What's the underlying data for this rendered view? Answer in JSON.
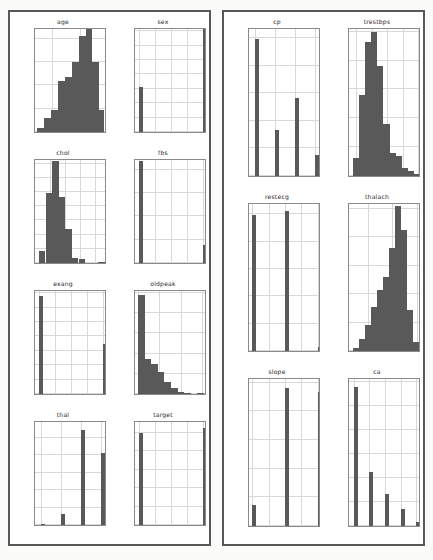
{
  "figure": {
    "kind": "histogram-grid",
    "background_color": "#ffffff",
    "bar_color": "#595959",
    "grid_color": "#d8d8d8",
    "axis_color": "#8a8a8a",
    "panel_border_color": "#585858",
    "panels": [
      {
        "name": "left-panel",
        "rows": 4,
        "cols": 2
      },
      {
        "name": "right-panel",
        "rows": 3,
        "cols": 2
      }
    ]
  },
  "chart_data": [
    {
      "type": "bar",
      "title": "age",
      "panel": "left",
      "row": 0,
      "col": 0,
      "xlabel": "",
      "ylabel": "",
      "grid": true,
      "xlim": [
        27.5,
        79.5
      ],
      "ylim": [
        0,
        225
      ],
      "xticks": [
        40,
        60
      ],
      "xticklabels": [
        "40",
        "60"
      ],
      "yticks": [
        0,
        50,
        100,
        150,
        200
      ],
      "yticklabels": [
        "0",
        "50",
        "100",
        "150",
        "200"
      ],
      "bin_edges": [
        29,
        34,
        39,
        44,
        49,
        54,
        59,
        64,
        69,
        74,
        77
      ],
      "values": [
        8,
        31,
        47,
        110,
        118,
        150,
        205,
        220,
        150,
        47,
        12
      ]
    },
    {
      "type": "bar",
      "title": "sex",
      "panel": "left",
      "row": 0,
      "col": 1,
      "xlabel": "",
      "ylabel": "",
      "grid": true,
      "xlim": [
        -0.06,
        1.06
      ],
      "ylim": [
        0,
        730
      ],
      "xticks": [
        0.0,
        0.25,
        0.5,
        0.75,
        1.0
      ],
      "xticklabels": [
        "0.00",
        "0.25",
        "0.50",
        "0.75",
        "1.00"
      ],
      "yticks": [
        0,
        100,
        200,
        300,
        400,
        500,
        600,
        700
      ],
      "yticklabels": [
        "0",
        "100",
        "200",
        "300",
        "400",
        "500",
        "600",
        "700"
      ],
      "categories": [
        0,
        1
      ],
      "values": [
        312,
        713
      ]
    },
    {
      "type": "bar",
      "title": "chol",
      "panel": "left",
      "row": 1,
      "col": 0,
      "xlabel": "",
      "ylabel": "",
      "grid": true,
      "xlim": [
        100,
        580
      ],
      "ylim": [
        0,
        370
      ],
      "xticks": [
        200,
        300,
        400,
        500
      ],
      "xticklabels": [
        "200",
        "300",
        "400",
        "500"
      ],
      "yticks": [
        0,
        50,
        100,
        150,
        200,
        250,
        300,
        350
      ],
      "yticklabels": [
        "0",
        "50",
        "100",
        "150",
        "200",
        "250",
        "300",
        "350"
      ],
      "bin_edges": [
        126,
        170,
        214,
        258,
        302,
        346,
        390,
        434,
        478,
        522,
        566
      ],
      "values": [
        42,
        248,
        360,
        232,
        120,
        18,
        14,
        0,
        0,
        2
      ]
    },
    {
      "type": "bar",
      "title": "fbs",
      "panel": "left",
      "row": 1,
      "col": 1,
      "xlabel": "",
      "ylabel": "",
      "grid": true,
      "xlim": [
        -0.06,
        1.06
      ],
      "ylim": [
        0,
        900
      ],
      "xticks": [
        0.0,
        0.25,
        0.5,
        0.75,
        1.0
      ],
      "xticklabels": [
        "0.00",
        "0.25",
        "0.50",
        "0.75",
        "1.00"
      ],
      "yticks": [
        0,
        200,
        400,
        600,
        800
      ],
      "yticklabels": [
        "0",
        "200",
        "400",
        "600",
        "800"
      ],
      "categories": [
        0,
        1
      ],
      "values": [
        872,
        153
      ]
    },
    {
      "type": "bar",
      "title": "exang",
      "panel": "left",
      "row": 2,
      "col": 0,
      "xlabel": "",
      "ylabel": "",
      "grid": true,
      "xlim": [
        -0.06,
        1.06
      ],
      "ylim": [
        0,
        730
      ],
      "xticks": [
        0.0,
        0.25,
        0.5,
        0.75,
        1.0
      ],
      "xticklabels": [
        "0.00",
        "0.25",
        "0.50",
        "0.75",
        "1.00"
      ],
      "yticks": [
        0,
        100,
        200,
        300,
        400,
        500,
        600,
        700
      ],
      "yticklabels": [
        "0",
        "100",
        "200",
        "300",
        "400",
        "500",
        "600",
        "700"
      ],
      "categories": [
        0,
        1
      ],
      "values": [
        680,
        345
      ]
    },
    {
      "type": "bar",
      "title": "oldpeak",
      "panel": "left",
      "row": 2,
      "col": 1,
      "xlabel": "",
      "ylabel": "",
      "grid": true,
      "xlim": [
        -0.3,
        6.5
      ],
      "ylim": [
        0,
        520
      ],
      "xticks": [
        0,
        2,
        4,
        6
      ],
      "xticklabels": [
        "0",
        "2",
        "4",
        "6"
      ],
      "yticks": [
        0,
        100,
        200,
        300,
        400,
        500
      ],
      "yticklabels": [
        "0",
        "100",
        "200",
        "300",
        "400",
        "500"
      ],
      "bin_edges": [
        0.0,
        0.62,
        1.24,
        1.86,
        2.48,
        3.1,
        3.72,
        4.34,
        4.96,
        5.58,
        6.2
      ],
      "values": [
        492,
        175,
        150,
        110,
        60,
        28,
        8,
        4,
        0,
        2
      ]
    },
    {
      "type": "bar",
      "title": "thal",
      "panel": "left",
      "row": 3,
      "col": 0,
      "xlabel": "",
      "ylabel": "",
      "grid": true,
      "xlim": [
        -0.3,
        3.3
      ],
      "ylim": [
        0,
        600
      ],
      "xticks": [
        0,
        1,
        2,
        3
      ],
      "xticklabels": [
        "0",
        "1",
        "2",
        "3"
      ],
      "yticks": [
        0,
        100,
        200,
        300,
        400,
        500
      ],
      "yticklabels": [
        "0",
        "100",
        "200",
        "300",
        "400",
        "500"
      ],
      "categories": [
        0,
        1,
        2,
        3
      ],
      "values": [
        7,
        64,
        544,
        410
      ]
    },
    {
      "type": "bar",
      "title": "target",
      "panel": "left",
      "row": 3,
      "col": 1,
      "xlabel": "",
      "ylabel": "",
      "grid": true,
      "xlim": [
        -0.06,
        1.06
      ],
      "ylim": [
        0,
        570
      ],
      "xticks": [
        0.0,
        0.25,
        0.5,
        0.75,
        1.0
      ],
      "xticklabels": [
        "0.00",
        "0.25",
        "0.50",
        "0.75",
        "1.00"
      ],
      "yticks": [
        0,
        100,
        200,
        300,
        400,
        500
      ],
      "yticklabels": [
        "0",
        "100",
        "200",
        "300",
        "400",
        "500"
      ],
      "categories": [
        0,
        1
      ],
      "values": [
        499,
        526
      ]
    },
    {
      "type": "bar",
      "title": "cp",
      "panel": "right",
      "row": 0,
      "col": 0,
      "xlabel": "",
      "ylabel": "",
      "grid": true,
      "xlim": [
        -0.3,
        3.3
      ],
      "ylim": [
        0,
        540
      ],
      "xticks": [
        0,
        1,
        2,
        3
      ],
      "xticklabels": [
        "0",
        "1",
        "2",
        "3"
      ],
      "yticks": [
        0,
        100,
        200,
        300,
        400,
        500
      ],
      "yticklabels": [
        "0",
        "100",
        "200",
        "300",
        "400",
        "500"
      ],
      "categories": [
        0,
        1,
        2,
        3
      ],
      "values": [
        497,
        167,
        284,
        77
      ]
    },
    {
      "type": "bar",
      "title": "trestbps",
      "panel": "right",
      "row": 0,
      "col": 1,
      "xlabel": "",
      "ylabel": "",
      "grid": true,
      "xlim": [
        88,
        205
      ],
      "ylim": [
        0,
        258
      ],
      "xticks": [
        100,
        125,
        150,
        175,
        200
      ],
      "xticklabels": [
        "100",
        "125",
        "150",
        "175",
        "200"
      ],
      "yticks": [
        0,
        50,
        100,
        150,
        200,
        250
      ],
      "yticklabels": [
        "0",
        "50",
        "100",
        "150",
        "200",
        "250"
      ],
      "bin_edges": [
        94,
        104,
        114,
        124,
        134,
        144,
        154,
        164,
        174,
        184,
        194,
        202
      ],
      "values": [
        32,
        140,
        232,
        250,
        190,
        90,
        40,
        35,
        14,
        8,
        3
      ]
    },
    {
      "type": "bar",
      "title": "restecg",
      "panel": "right",
      "row": 1,
      "col": 0,
      "xlabel": "",
      "ylabel": "",
      "grid": true,
      "xlim": [
        -0.1,
        2.1
      ],
      "ylim": [
        0,
        545
      ],
      "xticks": [
        0.0,
        0.5,
        1.0,
        1.5,
        2.0
      ],
      "xticklabels": [
        "0.0",
        "0.5",
        "1.0",
        "1.5",
        "2.0"
      ],
      "yticks": [
        0,
        100,
        200,
        300,
        400,
        500
      ],
      "yticklabels": [
        "0",
        "100",
        "200",
        "300",
        "400",
        "500"
      ],
      "categories": [
        0,
        1,
        2
      ],
      "values": [
        497,
        513,
        15
      ]
    },
    {
      "type": "bar",
      "title": "thalach",
      "panel": "right",
      "row": 1,
      "col": 1,
      "xlabel": "",
      "ylabel": "",
      "grid": true,
      "xlim": [
        62,
        208
      ],
      "ylim": [
        0,
        262
      ],
      "xticks": [
        100,
        150,
        200
      ],
      "xticklabels": [
        "100",
        "150",
        "200"
      ],
      "yticks": [
        0,
        50,
        100,
        150,
        200,
        250
      ],
      "yticklabels": [
        "0",
        "50",
        "100",
        "150",
        "200",
        "250"
      ],
      "bin_edges": [
        71,
        83,
        95,
        107,
        119,
        131,
        143,
        155,
        167,
        179,
        191,
        203
      ],
      "values": [
        5,
        22,
        45,
        78,
        108,
        130,
        182,
        255,
        212,
        72,
        16
      ]
    },
    {
      "type": "bar",
      "title": "slope",
      "panel": "right",
      "row": 2,
      "col": 0,
      "xlabel": "",
      "ylabel": "",
      "grid": true,
      "xlim": [
        -0.1,
        2.1
      ],
      "ylim": [
        0,
        520
      ],
      "xticks": [
        0.0,
        0.5,
        1.0,
        1.5,
        2.0
      ],
      "xticklabels": [
        "0.0",
        "0.5",
        "1.0",
        "1.5",
        "2.0"
      ],
      "yticks": [
        0,
        100,
        200,
        300,
        400,
        500
      ],
      "yticklabels": [
        "0",
        "100",
        "200",
        "300",
        "400",
        "500"
      ],
      "categories": [
        0,
        1,
        2
      ],
      "values": [
        74,
        482,
        469
      ]
    },
    {
      "type": "bar",
      "title": "ca",
      "panel": "right",
      "row": 2,
      "col": 1,
      "xlabel": "",
      "ylabel": "",
      "grid": true,
      "xlim": [
        -0.3,
        4.3
      ],
      "ylim": [
        0,
        620
      ],
      "xticks": [
        0,
        1,
        2,
        3,
        4
      ],
      "xticklabels": [
        "0",
        "1",
        "2",
        "3",
        "4"
      ],
      "yticks": [
        0,
        100,
        200,
        300,
        400,
        500,
        600
      ],
      "yticklabels": [
        "0",
        "100",
        "200",
        "300",
        "400",
        "500",
        "600"
      ],
      "categories": [
        0,
        1,
        2,
        3,
        4
      ],
      "values": [
        578,
        226,
        134,
        69,
        18
      ]
    }
  ]
}
